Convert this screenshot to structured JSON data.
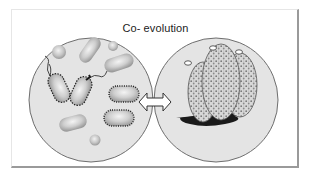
{
  "figure": {
    "title": "Co- evolution",
    "panels": [
      {
        "id": "left",
        "subject": "bacteria-community",
        "description": "Circle containing rod and coccus shaped microbes, some with flagella and surface appendages"
      },
      {
        "id": "right",
        "subject": "host-organism",
        "description": "Circle containing three stippled elongated sac-like bodies with openings at top, attached to a dark substrate"
      }
    ],
    "connector": "double-headed-arrow",
    "colors": {
      "circle_fill": "#e4e4e4",
      "circle_stroke": "#6e6e6e",
      "microbe_fill": "#c8c8c8",
      "ink": "#1a1a1a",
      "frame_shadow": "#9a9a9a"
    }
  }
}
